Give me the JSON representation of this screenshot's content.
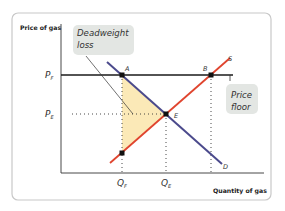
{
  "diagram": {
    "type": "price-floor-supply-demand",
    "axes": {
      "y_label": "Price of gas",
      "x_label": "Quantity of gas"
    },
    "price_ticks": [
      {
        "main": "P",
        "sub": "F"
      },
      {
        "main": "P",
        "sub": "E"
      }
    ],
    "quantity_ticks": [
      {
        "main": "Q",
        "sub": "F"
      },
      {
        "main": "Q",
        "sub": "E"
      }
    ],
    "curves": {
      "supply": {
        "label": "S",
        "color": "#e0442e"
      },
      "demand": {
        "label": "D",
        "color": "#4b4a8c"
      },
      "price_floor_line": {
        "color": "#1a1a1a"
      }
    },
    "points": {
      "A": "A",
      "B": "B",
      "E": "E"
    },
    "callouts": {
      "deadweight_loss": [
        "Deadweight",
        "loss"
      ],
      "price_floor": [
        "Price",
        "floor"
      ]
    },
    "colors": {
      "deadweight_fill": "#fbe9b7",
      "callout_bg": "#e3e6e3",
      "panel_border": "#c8c8c8"
    }
  }
}
